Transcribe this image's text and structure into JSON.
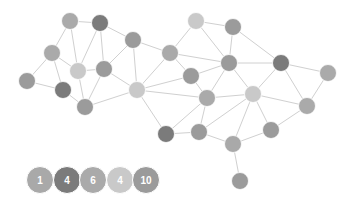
{
  "diagram": {
    "type": "network-graph",
    "edge_color": "#d0d0d0",
    "groups": [
      {
        "id": "g1",
        "color": "#a9a9a9",
        "count_label": "1"
      },
      {
        "id": "g2",
        "color": "#7b7b7b",
        "count_label": "4"
      },
      {
        "id": "g3",
        "color": "#aaaaaa",
        "count_label": "6"
      },
      {
        "id": "g4",
        "color": "#c9c9c9",
        "count_label": "4"
      },
      {
        "id": "g5",
        "color": "#9b9b9b",
        "count_label": "10"
      }
    ],
    "nodes": [
      {
        "id": 0,
        "x": 70,
        "y": 21,
        "group": "g3"
      },
      {
        "id": 1,
        "x": 100,
        "y": 23,
        "group": "g2"
      },
      {
        "id": 2,
        "x": 52,
        "y": 53,
        "group": "g3"
      },
      {
        "id": 3,
        "x": 78,
        "y": 71,
        "group": "g4"
      },
      {
        "id": 4,
        "x": 104,
        "y": 69,
        "group": "g5"
      },
      {
        "id": 5,
        "x": 27,
        "y": 81,
        "group": "g5"
      },
      {
        "id": 6,
        "x": 63,
        "y": 90,
        "group": "g2"
      },
      {
        "id": 7,
        "x": 85,
        "y": 107,
        "group": "g5"
      },
      {
        "id": 8,
        "x": 133,
        "y": 40,
        "group": "g5"
      },
      {
        "id": 9,
        "x": 170,
        "y": 53,
        "group": "g3"
      },
      {
        "id": 10,
        "x": 196,
        "y": 21,
        "group": "g4"
      },
      {
        "id": 11,
        "x": 233,
        "y": 27,
        "group": "g5"
      },
      {
        "id": 12,
        "x": 191,
        "y": 76,
        "group": "g5"
      },
      {
        "id": 13,
        "x": 137,
        "y": 90,
        "group": "g4"
      },
      {
        "id": 14,
        "x": 229,
        "y": 63,
        "group": "g5"
      },
      {
        "id": 15,
        "x": 281,
        "y": 63,
        "group": "g2"
      },
      {
        "id": 16,
        "x": 328,
        "y": 73,
        "group": "g3"
      },
      {
        "id": 17,
        "x": 207,
        "y": 98,
        "group": "g3"
      },
      {
        "id": 18,
        "x": 253,
        "y": 94,
        "group": "g4"
      },
      {
        "id": 19,
        "x": 307,
        "y": 106,
        "group": "g3"
      },
      {
        "id": 20,
        "x": 166,
        "y": 134,
        "group": "g2"
      },
      {
        "id": 21,
        "x": 199,
        "y": 132,
        "group": "g5"
      },
      {
        "id": 22,
        "x": 233,
        "y": 144,
        "group": "g1"
      },
      {
        "id": 23,
        "x": 271,
        "y": 130,
        "group": "g5"
      },
      {
        "id": 24,
        "x": 240,
        "y": 181,
        "group": "g5"
      }
    ],
    "edges": [
      [
        0,
        1
      ],
      [
        0,
        2
      ],
      [
        0,
        3
      ],
      [
        1,
        3
      ],
      [
        1,
        4
      ],
      [
        1,
        8
      ],
      [
        2,
        5
      ],
      [
        2,
        3
      ],
      [
        2,
        6
      ],
      [
        5,
        6
      ],
      [
        6,
        7
      ],
      [
        3,
        7
      ],
      [
        3,
        4
      ],
      [
        4,
        7
      ],
      [
        4,
        8
      ],
      [
        4,
        13
      ],
      [
        8,
        13
      ],
      [
        7,
        13
      ],
      [
        8,
        9
      ],
      [
        9,
        10
      ],
      [
        10,
        11
      ],
      [
        10,
        14
      ],
      [
        11,
        14
      ],
      [
        9,
        14
      ],
      [
        9,
        12
      ],
      [
        9,
        13
      ],
      [
        12,
        14
      ],
      [
        12,
        17
      ],
      [
        13,
        12
      ],
      [
        13,
        17
      ],
      [
        14,
        17
      ],
      [
        17,
        18
      ],
      [
        14,
        15
      ],
      [
        11,
        15
      ],
      [
        15,
        16
      ],
      [
        14,
        18
      ],
      [
        15,
        18
      ],
      [
        15,
        19
      ],
      [
        16,
        19
      ],
      [
        18,
        19
      ],
      [
        18,
        21
      ],
      [
        18,
        22
      ],
      [
        18,
        23
      ],
      [
        19,
        23
      ],
      [
        23,
        22
      ],
      [
        13,
        20
      ],
      [
        17,
        20
      ],
      [
        17,
        21
      ],
      [
        20,
        21
      ],
      [
        21,
        22
      ],
      [
        22,
        24
      ]
    ],
    "node_radius": 8.5,
    "legend": {
      "y": 180,
      "radius": 13.5,
      "x_positions": [
        40,
        67,
        93,
        120,
        146
      ]
    }
  }
}
